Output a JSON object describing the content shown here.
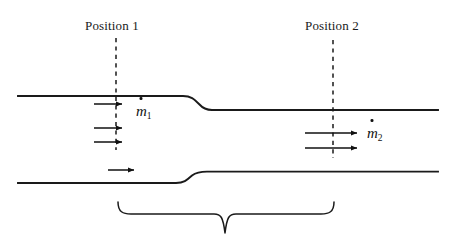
{
  "diagram": {
    "type": "duct-contraction-mass-flow",
    "background_color": "#ffffff",
    "line_color": "#1a1a1a",
    "labels": {
      "position_1": "Position 1",
      "position_2": "Position 2"
    },
    "flow_symbols": {
      "inlet_symbol": "m",
      "inlet_subscript": "1",
      "outlet_symbol": "m",
      "outlet_subscript": "2"
    },
    "geometry": {
      "duct": {
        "x_start": 18,
        "x_end": 438,
        "top_wall_inlet_y": 96,
        "top_wall_outlet_y": 110,
        "bottom_wall_inlet_y": 183,
        "bottom_wall_outlet_y": 172,
        "top_transition_x_start": 183,
        "top_transition_x_end": 212,
        "bottom_transition_x_start": 176,
        "bottom_transition_x_end": 207,
        "inlet_height": 87,
        "outlet_height": 62
      },
      "dashed_lines": [
        {
          "name": "position-1",
          "x": 116,
          "y_top": 38,
          "y_bottom": 150
        },
        {
          "name": "position-2",
          "x": 333,
          "y_top": 40,
          "y_bottom": 158
        }
      ],
      "inlet_arrows": [
        {
          "x_start": 94,
          "x_end": 124,
          "y": 104
        },
        {
          "x_start": 94,
          "x_end": 124,
          "y": 128
        },
        {
          "x_start": 94,
          "x_end": 124,
          "y": 142
        },
        {
          "x_start": 108,
          "x_end": 136,
          "y": 170
        }
      ],
      "outlet_arrows": [
        {
          "x_start": 305,
          "x_end": 359,
          "y": 133
        },
        {
          "x_start": 305,
          "x_end": 359,
          "y": 148
        }
      ],
      "brace": {
        "x_left": 118,
        "x_right": 334,
        "y_top": 202,
        "y_tip": 233,
        "x_tip": 225
      }
    }
  }
}
